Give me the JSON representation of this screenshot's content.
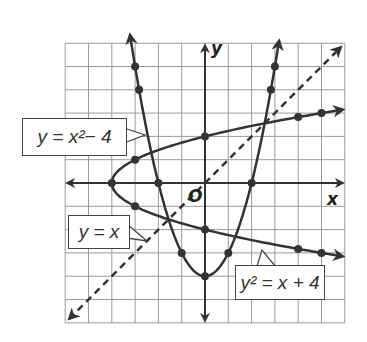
{
  "chart_data": {
    "type": "line",
    "title": "",
    "xlabel": "x",
    "ylabel": "y",
    "origin_label": "O",
    "xlim": [
      -6,
      6
    ],
    "ylim": [
      -6,
      6
    ],
    "grid": true,
    "grid_step": 1,
    "series": [
      {
        "name": "y = x^2 - 4",
        "label": "y = x²− 4",
        "style": "solid",
        "equation": "y = x^2 - 4",
        "points": [
          [
            -3,
            5
          ],
          [
            -2.83,
            4
          ],
          [
            -2,
            0
          ],
          [
            -1,
            -3
          ],
          [
            0,
            -4
          ],
          [
            1,
            -3
          ],
          [
            2,
            0
          ],
          [
            2.83,
            4
          ],
          [
            3,
            5
          ]
        ]
      },
      {
        "name": "y^2 = x + 4",
        "label": "y² = x + 4",
        "style": "solid",
        "equation": "y^2 = x + 4",
        "points": [
          [
            -4,
            0
          ],
          [
            -3,
            1
          ],
          [
            -3,
            -1
          ],
          [
            0,
            2
          ],
          [
            0,
            -2
          ],
          [
            4,
            2.83
          ],
          [
            4,
            -2.83
          ],
          [
            5,
            3
          ],
          [
            5,
            -3
          ]
        ]
      },
      {
        "name": "y = x",
        "label": "y = x",
        "style": "dashed",
        "equation": "y = x",
        "points": [
          [
            -6,
            -6
          ],
          [
            6,
            6
          ]
        ]
      }
    ]
  },
  "labels": {
    "parabola_up": "y = x²− 4",
    "line": "y = x",
    "parabola_side": "y² = x + 4",
    "x_axis": "x",
    "y_axis": "y",
    "origin": "O"
  }
}
